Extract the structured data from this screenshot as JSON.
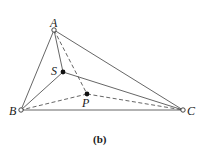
{
  "diagram": {
    "caption": "(b)",
    "points": {
      "A": {
        "label": "A",
        "x": 54,
        "y": 30,
        "style": "open"
      },
      "B": {
        "label": "B",
        "x": 21,
        "y": 110,
        "style": "open"
      },
      "C": {
        "label": "C",
        "x": 183,
        "y": 110,
        "style": "open"
      },
      "S": {
        "label": "S",
        "x": 63,
        "y": 72,
        "style": "filled"
      },
      "P": {
        "label": "P",
        "x": 87,
        "y": 94,
        "style": "filled"
      }
    },
    "segments": [
      {
        "from": "A",
        "to": "B",
        "style": "solid"
      },
      {
        "from": "A",
        "to": "C",
        "style": "solid"
      },
      {
        "from": "B",
        "to": "C",
        "style": "solid"
      },
      {
        "from": "A",
        "to": "S",
        "style": "solid"
      },
      {
        "from": "S",
        "to": "B",
        "style": "solid"
      },
      {
        "from": "S",
        "to": "C",
        "style": "solid"
      },
      {
        "from": "A",
        "to": "P",
        "style": "dashed"
      },
      {
        "from": "P",
        "to": "B",
        "style": "dashed"
      },
      {
        "from": "P",
        "to": "C",
        "style": "dashed"
      }
    ],
    "colors": {
      "line": "#555555",
      "point": "#111111"
    }
  }
}
